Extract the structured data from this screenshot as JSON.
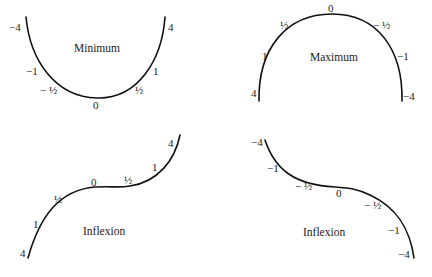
{
  "panels": [
    {
      "id": "minimum",
      "title": "Minimum",
      "labels": {
        "left_top": "−4",
        "left_mid": "−1",
        "left_low": "− ½",
        "bottom": "0",
        "right_low": "½",
        "right_mid": "1",
        "right_top": "4"
      }
    },
    {
      "id": "maximum",
      "title": "Maximum",
      "labels": {
        "left_bottom": "4",
        "left_mid": "1",
        "left_high": "½",
        "top": "0",
        "right_high": "− ½",
        "right_mid": "−1",
        "right_bottom": "−4"
      }
    },
    {
      "id": "inflexion-rising",
      "title": "Inflexion",
      "labels": {
        "bottom": "4",
        "low": "1",
        "mid_low": "½",
        "center": "0",
        "mid_high": "½",
        "high": "1",
        "top": "4"
      }
    },
    {
      "id": "inflexion-falling",
      "title": "Inflexion",
      "labels": {
        "top": "−4",
        "high": "−1",
        "mid_high": "− ½",
        "center": "0",
        "mid_low": "− ½",
        "low": "−1",
        "bottom": "−4"
      }
    }
  ],
  "colors": {
    "stroke": "#111111",
    "text": "#222222",
    "background": "#ffffff"
  }
}
